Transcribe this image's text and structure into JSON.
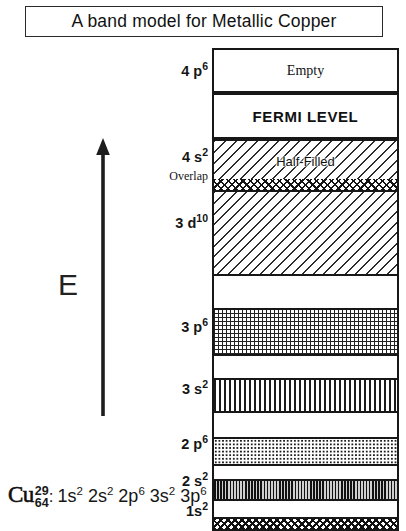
{
  "title": {
    "text": "A band model for  Metallic Copper"
  },
  "axis": {
    "energy_label": "E",
    "arrow_direction": "up"
  },
  "diagram": {
    "bands": [
      {
        "id": "4p6",
        "label": "4 p",
        "superscript": "6",
        "inner_text": "Empty",
        "fill": "empty",
        "top": 0,
        "height": 43
      },
      {
        "id": "fermi",
        "label": "",
        "superscript": "",
        "inner_text": "FERMI LEVEL",
        "fill": "empty",
        "top": 43,
        "height": 44
      },
      {
        "id": "4s2",
        "label": "4 s",
        "superscript": "2",
        "inner_text": "Half-Filled",
        "fill": "diagonal-hatch",
        "top": 87,
        "height": 44
      },
      {
        "id": "overlap",
        "label": "Overlap",
        "superscript": "",
        "inner_text": "",
        "fill": "cross-hatch",
        "top": 123,
        "height": 14
      },
      {
        "id": "3d10",
        "label": "3 d",
        "superscript": "10",
        "inner_text": "",
        "fill": "diagonal-hatch",
        "top": 136,
        "height": 85
      },
      {
        "id": "gap1",
        "label": "",
        "superscript": "",
        "inner_text": "",
        "fill": "empty",
        "top": 219,
        "height": 37
      },
      {
        "id": "3p6",
        "label": "3 p",
        "superscript": "6",
        "inner_text": "",
        "fill": "grid",
        "top": 254,
        "height": 48
      },
      {
        "id": "gap2",
        "label": "",
        "superscript": "",
        "inner_text": "",
        "fill": "empty",
        "top": 300,
        "height": 25
      },
      {
        "id": "3s2",
        "label": "3 s",
        "superscript": "2",
        "inner_text": "",
        "fill": "vertical-lines",
        "top": 323,
        "height": 33
      },
      {
        "id": "gap3",
        "label": "",
        "superscript": "",
        "inner_text": "",
        "fill": "empty",
        "top": 354,
        "height": 28
      },
      {
        "id": "2p6",
        "label": "2 p",
        "superscript": "6",
        "inner_text": "",
        "fill": "dots",
        "top": 380,
        "height": 28
      },
      {
        "id": "gap4",
        "label": "",
        "superscript": "",
        "inner_text": "",
        "fill": "empty",
        "top": 406,
        "height": 17
      },
      {
        "id": "2s2",
        "label": "2 s",
        "superscript": "2",
        "inner_text": "",
        "fill": "vertical-dense",
        "top": 421,
        "height": 21
      },
      {
        "id": "gap5",
        "label": "",
        "superscript": "",
        "inner_text": "",
        "fill": "empty",
        "top": 440,
        "height": 19
      },
      {
        "id": "1s2",
        "label": "1s",
        "superscript": "2",
        "inner_text": "",
        "fill": "zigzag",
        "top": 457,
        "height": 13
      }
    ]
  },
  "footer": {
    "element_symbol": "Cu",
    "atomic_number": "29",
    "mass_number": "64",
    "separator": ":",
    "configuration": [
      {
        "shell": "1s",
        "electrons": "2"
      },
      {
        "shell": "2s",
        "electrons": "2"
      },
      {
        "shell": "2p",
        "electrons": "6"
      },
      {
        "shell": "3s",
        "electrons": "2"
      },
      {
        "shell": "3p",
        "electrons": "6"
      },
      {
        "shell": "3d",
        "electrons": "10"
      },
      {
        "shell": "4s",
        "electrons": "1"
      }
    ]
  },
  "colors": {
    "ink": "#171717",
    "background": "#ffffff"
  }
}
